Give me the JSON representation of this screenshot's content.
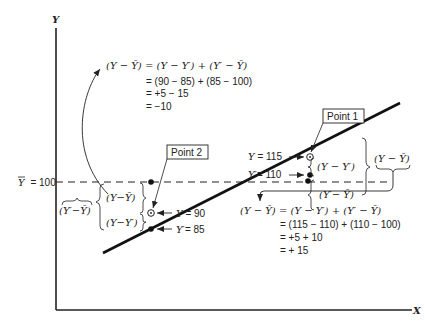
{
  "axes": {
    "y_label": "Y",
    "x_label": "X"
  },
  "mean_line": {
    "label": "Ȳ = 100",
    "label_bar": "Y",
    "label_value": "= 100"
  },
  "point1": {
    "label": "Point 1",
    "y_obs_label": "Y = 115",
    "y_pred_label": "Y′= 110",
    "brace_upper": "(Y − Y′)",
    "brace_lower": "(Y′− Ȳ)",
    "brace_total": "(Y − Ȳ)"
  },
  "point2": {
    "label": "Point 2",
    "y_obs_label": "Y = 90",
    "y_pred_label": "Y′= 85",
    "brace_upper": "(Y−Ȳ)",
    "brace_lower": "(Y−Y′)",
    "brace_total": "(Y′−Ȳ)"
  },
  "equation_top": {
    "line1": "(Y − Ȳ) = (Y − Y′) + (Y′ − Ȳ)",
    "line2": "= (90 − 85) + (85 − 100)",
    "line3": "= +5 − 15",
    "line4": "= −10"
  },
  "equation_bottom": {
    "line1": "(Y − Ȳ) = (Y − Y′) + (Y′ − Ȳ)",
    "line2": "= (115 − 110) + (110 − 100)",
    "line3": "= +5 + 10",
    "line4": "= + 15"
  },
  "colors": {
    "ink": "#222222",
    "background": "#ffffff"
  }
}
